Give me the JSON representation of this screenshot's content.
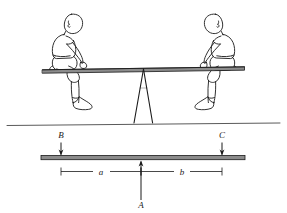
{
  "figure": {
    "name": "seesaw-lever-diagram",
    "background_color": "#ffffff",
    "ink_color": "#1a1a1a",
    "width": 287,
    "height": 213
  },
  "upper_scene": {
    "name": "seesaw-pictorial",
    "plank_label": "seesaw-plank",
    "fulcrum_label": "fulcrum-a-frame",
    "ground_label": "ground-line",
    "left_child_label": "child-left",
    "right_child_label": "child-right"
  },
  "lower_scene": {
    "name": "free-body-lever-diagram",
    "bar_label": "lever-bar",
    "forces": [
      {
        "id": "B",
        "label": "B",
        "direction": "down",
        "x": 61,
        "description": "downward-force-left"
      },
      {
        "id": "C",
        "label": "C",
        "direction": "down",
        "x": 222,
        "description": "downward-force-right"
      },
      {
        "id": "A",
        "label": "A",
        "direction": "up",
        "x": 141,
        "description": "upward-force-fulcrum"
      }
    ],
    "dimensions": [
      {
        "id": "a",
        "label": "a",
        "from_x": 61,
        "to_x": 141,
        "description": "distance-left-segment"
      },
      {
        "id": "b",
        "label": "b",
        "from_x": 141,
        "to_x": 222,
        "description": "distance-right-segment"
      }
    ]
  }
}
